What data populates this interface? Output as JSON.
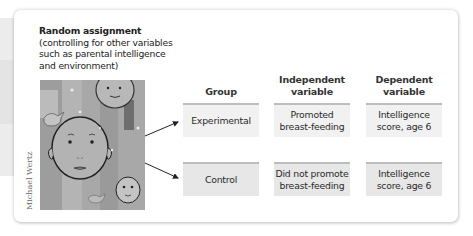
{
  "title": {
    "heading": "Random assignment",
    "lines": [
      "(controlling for other variables",
      "such as parental intelligence",
      "and environment)"
    ]
  },
  "image": {
    "description": "painting-of-child-faces",
    "credit": "Michael Wertz"
  },
  "table": {
    "headers": {
      "group": [
        "Group"
      ],
      "independent": [
        "Independent",
        "variable"
      ],
      "dependent": [
        "Dependent",
        "variable"
      ]
    },
    "rows": [
      {
        "group": "Experimental",
        "independent": [
          "Promoted",
          "breast-feeding"
        ],
        "dependent": [
          "Intelligence",
          "score, age 6"
        ]
      },
      {
        "group": "Control",
        "independent": [
          "Did not promote",
          "breast-feeding"
        ],
        "dependent": [
          "Intelligence",
          "score, age 6"
        ]
      }
    ]
  },
  "colors": {
    "cell_row1": "#f1f1f1",
    "cell_row2": "#e7e7e7",
    "cell_top_border": "#bdbdbd",
    "arrow": "#222222"
  }
}
